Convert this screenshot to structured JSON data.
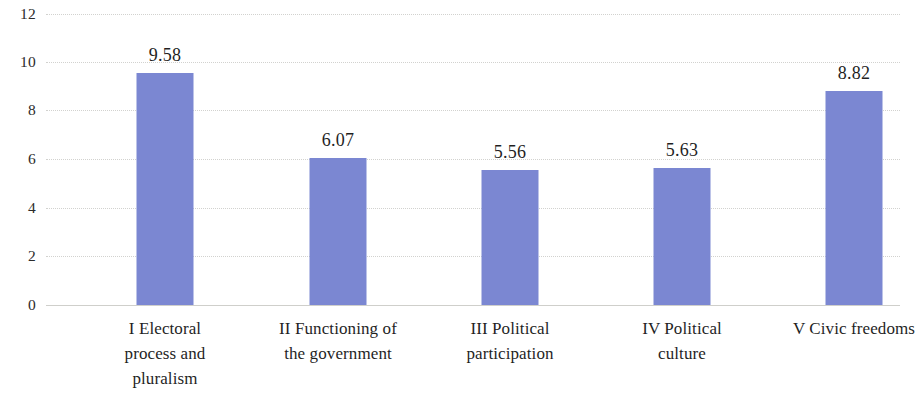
{
  "chart_data": {
    "type": "bar",
    "title": "",
    "subtitle": "",
    "xlabel": "",
    "ylabel": "",
    "ylim": [
      0,
      12
    ],
    "y_ticks": [
      "0",
      "2",
      "4",
      "6",
      "8",
      "10",
      "12"
    ],
    "y_tick_values": [
      0,
      2,
      4,
      6,
      8,
      10,
      12
    ],
    "grid": true,
    "legend": false,
    "legend_position": "none",
    "bar_color": "#7b87d2",
    "categories": [
      "I Electoral process and pluralism",
      "II Functioning of the government",
      "III Political participation",
      "IV Political culture",
      "V Civic freedoms"
    ],
    "category_lines": [
      [
        "I Electoral",
        "process and",
        "pluralism"
      ],
      [
        "II Functioning of",
        "the government"
      ],
      [
        "III Political",
        "participation"
      ],
      [
        "IV Political",
        "culture"
      ],
      [
        "V Civic freedoms"
      ]
    ],
    "values": [
      9.58,
      6.07,
      5.56,
      5.63,
      8.82
    ],
    "value_labels": [
      "9.58",
      "6.07",
      "5.56",
      "5.63",
      "8.82"
    ]
  }
}
